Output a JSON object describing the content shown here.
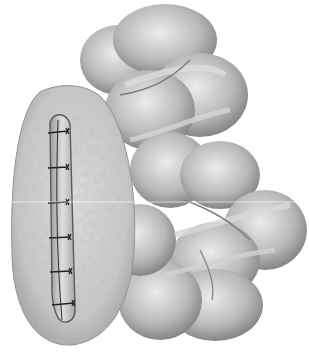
{
  "image": {
    "description": "Grayscale medical illustration of a colon segment with an omental patch covering a sutured linear incision",
    "width": 309,
    "height": 361,
    "background": "#ffffff",
    "palette": {
      "light": "#e6e6e6",
      "mid": "#b5b5b5",
      "dark": "#6e6e6e",
      "suture": "#222222"
    }
  },
  "subjects": [
    {
      "name": "colon",
      "role": "bowel loops forming an arc from top-center to lower-right"
    },
    {
      "name": "omental-patch",
      "role": "textured oval patch on the left"
    },
    {
      "name": "incision",
      "role": "vertical sutured closure inside the patch"
    }
  ],
  "sutures": {
    "count": 6,
    "y_positions": [
      133,
      168,
      203,
      238,
      272,
      305
    ]
  }
}
